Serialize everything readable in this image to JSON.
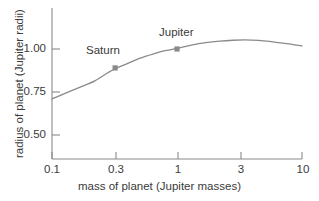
{
  "chart_data": {
    "type": "line",
    "title": "",
    "subtitle": "",
    "xlabel": "mass of planet (Jupiter masses)",
    "ylabel": "radius of planet (Jupiter radii)",
    "xscale": "log",
    "yscale": "linear",
    "xlim": [
      0.1,
      10
    ],
    "ylim": [
      0.38,
      1.12
    ],
    "grid": false,
    "legend": null,
    "xticks": [
      0.1,
      0.3,
      1,
      3,
      10
    ],
    "xticklabels": [
      "0.1",
      "0.3",
      "1",
      "3",
      "10"
    ],
    "yticks": [
      0.5,
      0.75,
      1.0
    ],
    "yticklabels": [
      "0.50",
      "0.75",
      "1.00"
    ],
    "series": [
      {
        "name": "mass-radius relation",
        "kind": "line",
        "color": "#8a8a8a",
        "x": [
          0.1,
          0.13,
          0.17,
          0.22,
          0.28,
          0.32,
          0.4,
          0.5,
          0.65,
          0.8,
          1.0,
          1.3,
          1.7,
          2.2,
          2.8,
          3.5,
          4.5,
          5.5,
          7.0,
          8.5,
          10.0
        ],
        "y": [
          0.71,
          0.745,
          0.78,
          0.815,
          0.862,
          0.885,
          0.915,
          0.945,
          0.972,
          0.99,
          1.003,
          1.022,
          1.037,
          1.046,
          1.051,
          1.053,
          1.05,
          1.044,
          1.034,
          1.026,
          1.018
        ]
      },
      {
        "name": "labeled planets",
        "kind": "scatter",
        "color": "#8a8a8a",
        "points": [
          {
            "label": "Saturn",
            "x": 0.32,
            "y": 0.89
          },
          {
            "label": "Jupiter",
            "x": 1.0,
            "y": 1.0
          }
        ]
      }
    ],
    "annotations": [
      {
        "text": "Saturn",
        "x": 0.195,
        "y": 0.985
      },
      {
        "text": "Jupiter",
        "x": 0.72,
        "y": 1.095
      }
    ]
  },
  "colors": {
    "axis": "#8a8a8a",
    "curve": "#8a8a8a",
    "marker": "#8a8a8a",
    "text": "#3a3a3a",
    "background": "#ffffff"
  },
  "axes": {
    "x_title": "mass of planet (Jupiter masses)",
    "y_title": "radius of planet (Jupiter radii)",
    "x_tick_labels": [
      "0.1",
      "0.3",
      "1",
      "3",
      "10"
    ],
    "y_tick_labels": [
      "0.50",
      "0.75",
      "1.00"
    ]
  },
  "point_labels": {
    "saturn": "Saturn",
    "jupiter": "Jupiter"
  }
}
